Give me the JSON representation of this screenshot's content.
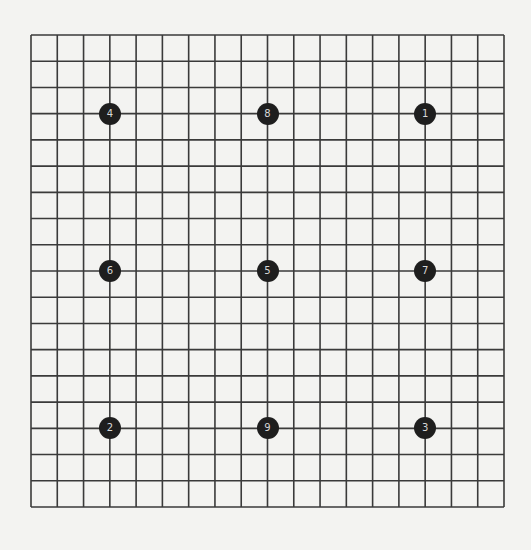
{
  "board": {
    "size": 19,
    "line_color": "#3a3a3a",
    "stone_color": "#1e1e1e",
    "label_color": "#d8d8d8",
    "stones": [
      {
        "label": "1",
        "col": 16,
        "row": 4
      },
      {
        "label": "2",
        "col": 4,
        "row": 16
      },
      {
        "label": "3",
        "col": 16,
        "row": 16
      },
      {
        "label": "4",
        "col": 4,
        "row": 4
      },
      {
        "label": "5",
        "col": 10,
        "row": 10
      },
      {
        "label": "6",
        "col": 4,
        "row": 10
      },
      {
        "label": "7",
        "col": 16,
        "row": 10
      },
      {
        "label": "8",
        "col": 10,
        "row": 4
      },
      {
        "label": "9",
        "col": 10,
        "row": 16
      }
    ]
  }
}
